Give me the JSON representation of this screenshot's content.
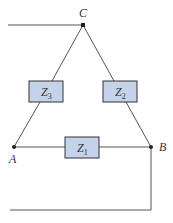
{
  "diagram": {
    "type": "delta-connected impedance network",
    "nodes": [
      {
        "id": "C",
        "label": "C"
      },
      {
        "id": "A",
        "label": "A"
      },
      {
        "id": "B",
        "label": "B"
      }
    ],
    "impedances": [
      {
        "id": "Z1",
        "label_main": "Z",
        "label_sub": "1",
        "between": [
          "A",
          "B"
        ]
      },
      {
        "id": "Z2",
        "label_main": "Z",
        "label_sub": "2",
        "between": [
          "C",
          "B"
        ]
      },
      {
        "id": "Z3",
        "label_main": "Z",
        "label_sub": "3",
        "between": [
          "C",
          "A"
        ]
      }
    ],
    "colors": {
      "wire": "#555555",
      "box_fill": "#c5d3ea",
      "box_stroke": "#333333",
      "node": "#222222"
    }
  }
}
